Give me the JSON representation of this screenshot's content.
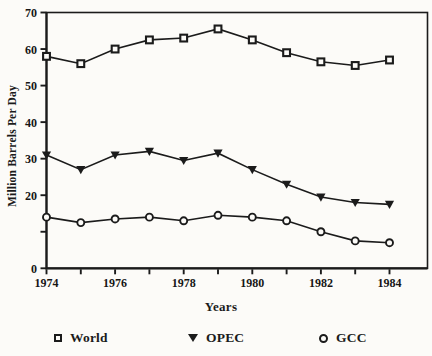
{
  "figure": {
    "background": "#fcfbf8",
    "ink": "#1b1b1b"
  },
  "chart_data": {
    "type": "line",
    "title": "",
    "xlabel": "Years",
    "ylabel": "Million Barrels Per Day",
    "x": [
      1974,
      1975,
      1976,
      1977,
      1978,
      1979,
      1980,
      1981,
      1982,
      1983,
      1984
    ],
    "x_labeled_years": [
      1974,
      1976,
      1978,
      1980,
      1982,
      1984
    ],
    "xlim": [
      1974,
      1985.1
    ],
    "ylim": [
      0,
      70
    ],
    "y_ticks": [
      0,
      10,
      20,
      30,
      40,
      50,
      60,
      70
    ],
    "y_tick_labels": [
      "0",
      "",
      "20",
      "30",
      "40",
      "50",
      "60",
      "70"
    ],
    "grid": false,
    "legend_position": "bottom",
    "series": [
      {
        "name": "World",
        "marker": "open-square",
        "values": [
          58,
          56,
          60,
          62.5,
          63,
          65.5,
          62.5,
          59,
          56.5,
          55.5,
          57
        ]
      },
      {
        "name": "OPEC",
        "marker": "filled-triangle-down",
        "values": [
          31,
          27,
          31,
          32,
          29.5,
          31.5,
          27,
          23,
          19.5,
          18,
          17.5
        ]
      },
      {
        "name": "GCC",
        "marker": "open-circle",
        "values": [
          14,
          12.5,
          13.5,
          14,
          13,
          14.5,
          14,
          13,
          10,
          7.5,
          7
        ]
      }
    ]
  }
}
